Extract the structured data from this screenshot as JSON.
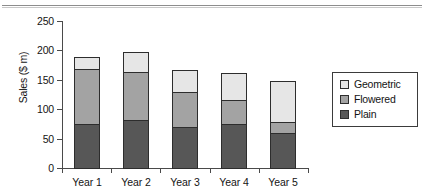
{
  "chart_data": {
    "type": "bar",
    "subtype": "stacked-bar",
    "title": "",
    "xlabel": "",
    "ylabel": "Sales ($ m)",
    "categories": [
      "Year 1",
      "Year 2",
      "Year 3",
      "Year 4",
      "Year 5"
    ],
    "ylim": [
      0,
      250
    ],
    "yticks": [
      0,
      50,
      100,
      150,
      200,
      250
    ],
    "ytick_labels": [
      "0",
      "50",
      "100",
      "150",
      "200",
      "250"
    ],
    "grid": false,
    "legend_position": "right",
    "stack_order_bottom_to_top": [
      "Plain",
      "Flowered",
      "Geometric"
    ],
    "series": [
      {
        "name": "Plain",
        "color": "#575757",
        "values": [
          74,
          81,
          70,
          75,
          60
        ]
      },
      {
        "name": "Flowered",
        "color": "#a3a3a3",
        "values": [
          94,
          83,
          60,
          40,
          19
        ]
      },
      {
        "name": "Geometric",
        "color": "#e6e6e6",
        "values": [
          21,
          33,
          36,
          47,
          69
        ]
      }
    ],
    "totals": [
      189,
      197,
      166,
      162,
      148
    ]
  },
  "legend": {
    "items": [
      {
        "label": "Geometric",
        "color": "#e6e6e6"
      },
      {
        "label": "Flowered",
        "color": "#a3a3a3"
      },
      {
        "label": "Plain",
        "color": "#575757"
      }
    ]
  }
}
